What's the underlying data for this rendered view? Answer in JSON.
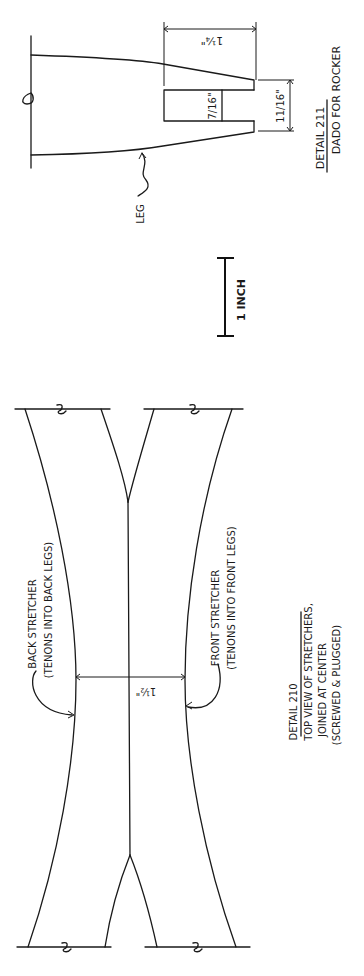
{
  "sheet": {
    "orientation": "rotated-90-ccw",
    "background": "#ffffff",
    "ink": "#1a1a1a"
  },
  "detail_211": {
    "title": "DETAIL 211",
    "subtitle": "DADO FOR ROCKER",
    "leader_label": "LEG",
    "dimensions": {
      "overall_depth": "1¼\"",
      "dado_depth": "7/16\"",
      "dado_width": "11/16\""
    }
  },
  "scale_bar": {
    "label": "1 INCH"
  },
  "detail_210": {
    "title": "DETAIL 210",
    "lines": [
      "TOP VIEW OF STRETCHERS,",
      "JOINED AT CENTER",
      "(SCREWED & PLUGGED)"
    ],
    "back_stretcher": {
      "label": "BACK STRETCHER",
      "note": "(TENONS INTO BACK LEGS)"
    },
    "front_stretcher": {
      "label": "FRONT STRETCHER",
      "note": "(TENONS INTO FRONT LEGS)"
    },
    "width_dimension": "1½\""
  }
}
